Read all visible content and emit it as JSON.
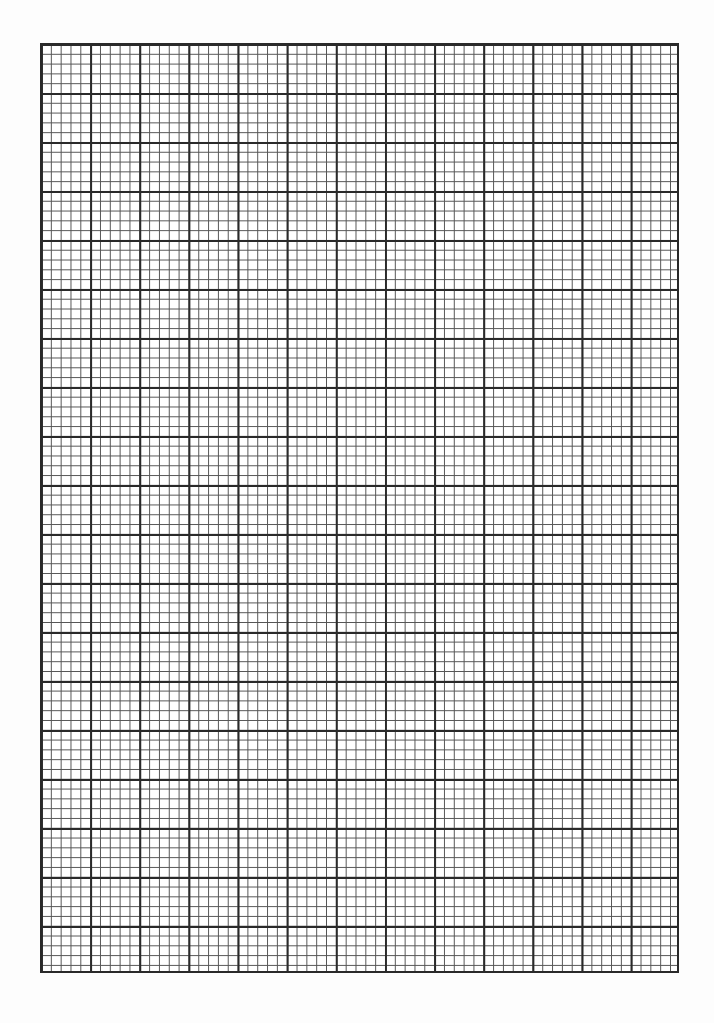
{
  "page": {
    "type": "graph-paper",
    "major_columns": 13,
    "major_rows": 19,
    "minor_per_major": 5,
    "colors": {
      "major_line": "#2a2a2a",
      "minor_line": "#555555",
      "paper": "#ffffff"
    }
  }
}
